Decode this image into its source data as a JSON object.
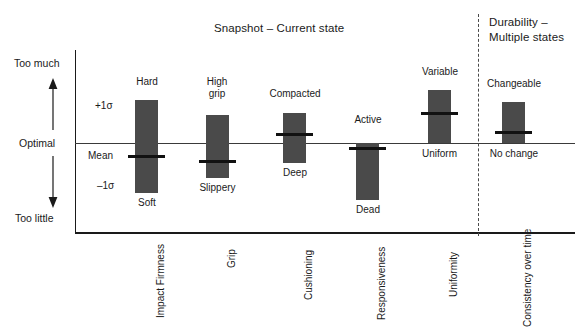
{
  "titles": {
    "snapshot": "Snapshot – Current state",
    "durability_line1": "Durability –",
    "durability_line2": "Multiple states"
  },
  "axis": {
    "y_top": "Too much",
    "y_middle": "Optimal",
    "y_bottom": "Too little"
  },
  "annotations": {
    "plus_sigma": "+1σ",
    "mean": "Mean",
    "minus_sigma": "–1σ"
  },
  "colors": {
    "bar": "#4a4a4a",
    "mean_marker": "#111111",
    "axis": "#1a1a1a",
    "divider": "#4a4a4a",
    "background": "#ffffff"
  },
  "chart_data": {
    "type": "bar",
    "title": "Snapshot – Current state",
    "xlabel": "",
    "ylabel": "",
    "ylim": [
      "Too little",
      "Too much"
    ],
    "grid": false,
    "legend": "none",
    "note": "Floating range bars (±1σ) about an Optimal baseline; thick horizontal rule on each bar marks the Mean. Values are expressed in sigma units relative to Optimal (0 = Optimal line).",
    "categories": [
      "Impact Firmness",
      "Grip",
      "Cushioning",
      "Responsiveness",
      "Uniformity",
      "Consistency over time"
    ],
    "groups": [
      {
        "name": "Snapshot – Current state",
        "categories": [
          "Impact Firmness",
          "Grip",
          "Cushioning",
          "Responsiveness",
          "Uniformity"
        ]
      },
      {
        "name": "Durability – Multiple states",
        "categories": [
          "Consistency over time"
        ]
      }
    ],
    "series": [
      {
        "name": "Range (+1σ to –1σ)",
        "values": [
          {
            "category": "Impact Firmness",
            "top_label": "Hard",
            "bottom_label": "Soft",
            "upper_sigma": 1.0,
            "lower_sigma": -1.0,
            "mean_sigma": -0.28
          },
          {
            "category": "Grip",
            "top_label": "High grip",
            "bottom_label": "Slippery",
            "upper_sigma": 0.6,
            "lower_sigma": -0.75,
            "mean_sigma": -0.38
          },
          {
            "category": "Cushioning",
            "top_label": "Compacted",
            "bottom_label": "Deep",
            "upper_sigma": 0.65,
            "lower_sigma": -0.43,
            "mean_sigma": 0.19
          },
          {
            "category": "Responsiveness",
            "top_label": "Active",
            "bottom_label": "Dead",
            "upper_sigma": 0.0,
            "lower_sigma": -1.22,
            "mean_sigma": -0.11
          },
          {
            "category": "Uniformity",
            "top_label": "Variable",
            "bottom_label": "Uniform",
            "upper_sigma": 1.13,
            "lower_sigma": 0.0,
            "mean_sigma": 0.64
          },
          {
            "category": "Consistency over time",
            "top_label": "Changeable",
            "bottom_label": "No change",
            "upper_sigma": 0.88,
            "lower_sigma": 0.0,
            "mean_sigma": 0.24
          }
        ]
      }
    ]
  },
  "bars": [
    {
      "category": "Impact Firmness",
      "top_label": "Hard",
      "bottom_label": "Soft",
      "x": 135,
      "width": 23,
      "top": 100,
      "height": 93,
      "mean_y": 155,
      "mean_x": 128,
      "mean_w": 37,
      "top_label_x": 130,
      "top_label_y": 76,
      "top_label_w": 34,
      "bottom_label_x": 128,
      "bottom_label_y": 197,
      "bottom_label_w": 38,
      "cat_x": 150,
      "cat_y": 318
    },
    {
      "category": "Grip",
      "top_label": "High\ngrip",
      "top_label_l1": "High",
      "top_label_l2": "grip",
      "bottom_label": "Slippery",
      "x": 206,
      "width": 23,
      "top": 115,
      "height": 63,
      "mean_y": 160,
      "mean_x": 199,
      "mean_w": 37,
      "top_label_x": 200,
      "top_label_y": 76,
      "top_label_w": 34,
      "bottom_label_x": 194,
      "bottom_label_y": 182,
      "bottom_label_w": 47,
      "cat_x": 221,
      "cat_y": 268
    },
    {
      "category": "Cushioning",
      "top_label": "Compacted",
      "bottom_label": "Deep",
      "x": 283,
      "width": 23,
      "top": 113,
      "height": 50,
      "mean_y": 133,
      "mean_x": 276,
      "mean_w": 37,
      "top_label_x": 266,
      "top_label_y": 88,
      "top_label_w": 58,
      "bottom_label_x": 277,
      "bottom_label_y": 167,
      "bottom_label_w": 36,
      "cat_x": 298,
      "cat_y": 300
    },
    {
      "category": "Responsiveness",
      "top_label": "Active",
      "bottom_label": "Dead",
      "x": 356,
      "width": 23,
      "top": 143,
      "height": 57,
      "mean_y": 147,
      "mean_x": 349,
      "mean_w": 37,
      "top_label_x": 350,
      "top_label_y": 114,
      "top_label_w": 36,
      "bottom_label_x": 350,
      "bottom_label_y": 204,
      "bottom_label_w": 36,
      "cat_x": 371,
      "cat_y": 320
    },
    {
      "category": "Uniformity",
      "top_label": "Variable",
      "bottom_label": "Uniform",
      "x": 428,
      "width": 23,
      "top": 90,
      "height": 53,
      "mean_y": 112,
      "mean_x": 421,
      "mean_w": 37,
      "top_label_x": 417,
      "top_label_y": 66,
      "top_label_w": 46,
      "bottom_label_x": 416,
      "bottom_label_y": 148,
      "bottom_label_w": 47,
      "cat_x": 443,
      "cat_y": 297
    },
    {
      "category": "Consistency over time",
      "top_label": "Changeable",
      "bottom_label": "No change",
      "x": 502,
      "width": 23,
      "top": 102,
      "height": 41,
      "mean_y": 131,
      "mean_x": 495,
      "mean_w": 37,
      "top_label_x": 484,
      "top_label_y": 78,
      "top_label_w": 60,
      "bottom_label_x": 486,
      "bottom_label_y": 148,
      "bottom_label_w": 56,
      "cat_x": 517,
      "cat_y": 327
    }
  ]
}
